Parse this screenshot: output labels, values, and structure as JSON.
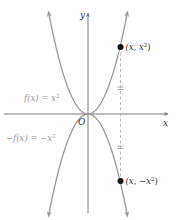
{
  "diagram": {
    "type": "function-graph",
    "origin_label": "O",
    "axes": {
      "x_label": "x",
      "y_label": "y"
    },
    "curves": [
      {
        "name": "f",
        "equation_label": "f(x) = x²",
        "kind": "upward-parabola",
        "color": "#9a9a9a"
      },
      {
        "name": "neg-f",
        "equation_label": "−f(x) = −x²",
        "kind": "downward-parabola",
        "color": "#9a9a9a"
      }
    ],
    "points": [
      {
        "label": "(x, x²)",
        "on_curve": "f"
      },
      {
        "label": "(x, −x²)",
        "on_curve": "neg-f"
      }
    ],
    "dashed_line": {
      "description": "vertical dashed line through both points, with equal-length tick marks above and below the x-axis"
    },
    "colors": {
      "curve": "#9a9a9a",
      "axis": "#7a7a7a",
      "point": "#111111",
      "dashed": "#b0b0b0"
    }
  },
  "labels": {
    "f_eq_prefix": "f(x) = x",
    "f_eq_exp": "2",
    "negf_eq_prefix": "−f(x) = −x",
    "negf_eq_exp": "2",
    "origin": "O",
    "x_axis": "x",
    "y_axis": "y",
    "point_top_prefix": "(x, x",
    "point_top_exp": "2",
    "point_top_suffix": ")",
    "point_bottom_prefix": "(x, −x",
    "point_bottom_exp": "2",
    "point_bottom_suffix": ")"
  }
}
